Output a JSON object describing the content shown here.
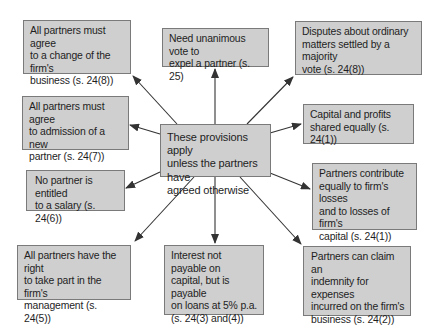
{
  "colors": {
    "box_fill": "#cfcfcf",
    "box_border": "#7a7a7a",
    "arrow": "#333333",
    "text": "#1e1e1e"
  },
  "center": {
    "text": "These provisions apply\nunless the partners have\nagreed otherwise"
  },
  "nodes": [
    {
      "id": "change-business",
      "text": "All partners must agree\nto a change of the firm's\nbusiness (s. 24(8))"
    },
    {
      "id": "expel-partner",
      "text": "Need unanimous vote to\nexpel a partner (s. 25)"
    },
    {
      "id": "disputes-majority",
      "text": "Disputes about ordinary\nmatters settled by a majority\nvote (s. 24(8))"
    },
    {
      "id": "admission-partner",
      "text": "All partners must agree\nto admission of a new\npartner (s. 24(7))"
    },
    {
      "id": "capital-profits",
      "text": "Capital and profits\nshared equally (s. 24(1))"
    },
    {
      "id": "no-salary",
      "text": "No partner is entitled\nto a salary (s. 24(6))"
    },
    {
      "id": "contribute-losses",
      "text": "Partners contribute\nequally to firm's losses\nand to losses of firm's\ncapital (s. 24(1))"
    },
    {
      "id": "management-right",
      "text": "All partners have the right\nto take part in the firm's\nmanagement (s. 24(5))"
    },
    {
      "id": "interest-capital",
      "text": "Interest not payable on\ncapital, but is payable\non loans at 5% p.a.\n(s. 24(3) and(4))"
    },
    {
      "id": "indemnity-expenses",
      "text": "Partners can claim an\nindemnity for expenses\nincurred on the firm's\nbusiness (s. 24(2))"
    }
  ]
}
